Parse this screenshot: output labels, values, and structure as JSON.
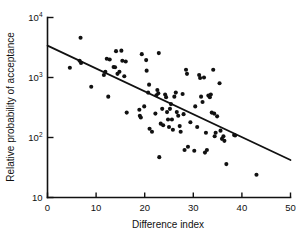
{
  "chart_data": {
    "type": "scatter",
    "title": "",
    "xlabel": "Difference index",
    "ylabel": "Relative probability of acceptance",
    "xlim": [
      0,
      50
    ],
    "ylim": [
      10,
      10000
    ],
    "yscale": "log",
    "xscale": "linear",
    "grid": false,
    "legend": null,
    "xticks": [
      0,
      10,
      20,
      30,
      40,
      50
    ],
    "xticklabels": [
      "0",
      "10",
      "20",
      "30",
      "40",
      "50"
    ],
    "yticks": [
      10,
      100,
      1000,
      10000
    ],
    "yticklabels": [
      "10",
      "10²",
      "10³",
      "10⁴"
    ],
    "ytick_mantissa": [
      "10",
      "10",
      "10",
      "10"
    ],
    "ytick_exponent": [
      "",
      "2",
      "3",
      "4"
    ],
    "series": [
      {
        "name": "observations",
        "marker": "filled-circle",
        "color": "#111111",
        "points": [
          [
            6.8,
            4600
          ],
          [
            4.6,
            1450
          ],
          [
            6.6,
            1900
          ],
          [
            6.9,
            1750
          ],
          [
            9.0,
            700
          ],
          [
            11.6,
            1100
          ],
          [
            11.9,
            1250
          ],
          [
            12.2,
            2050
          ],
          [
            12.8,
            2000
          ],
          [
            12.5,
            480
          ],
          [
            13.6,
            1500
          ],
          [
            13.9,
            1480
          ],
          [
            14.1,
            2750
          ],
          [
            14.4,
            1150
          ],
          [
            14.8,
            1250
          ],
          [
            15.2,
            2800
          ],
          [
            15.4,
            1900
          ],
          [
            15.8,
            1050
          ],
          [
            16.1,
            1850
          ],
          [
            16.3,
            260
          ],
          [
            18.9,
            290
          ],
          [
            19.0,
            230
          ],
          [
            19.2,
            215
          ],
          [
            19.4,
            2450
          ],
          [
            19.9,
            330
          ],
          [
            20.3,
            1950
          ],
          [
            20.4,
            1300
          ],
          [
            20.7,
            560
          ],
          [
            20.9,
            760
          ],
          [
            21.0,
            140
          ],
          [
            21.5,
            125
          ],
          [
            22.2,
            250
          ],
          [
            22.4,
            505
          ],
          [
            22.6,
            620
          ],
          [
            22.8,
            545
          ],
          [
            22.9,
            2550
          ],
          [
            23.0,
            47
          ],
          [
            23.3,
            170
          ],
          [
            23.6,
            300
          ],
          [
            23.8,
            160
          ],
          [
            24.2,
            520
          ],
          [
            24.4,
            470
          ],
          [
            24.6,
            265
          ],
          [
            24.8,
            200
          ],
          [
            25.0,
            150
          ],
          [
            25.2,
            300
          ],
          [
            25.4,
            360
          ],
          [
            25.6,
            200
          ],
          [
            25.8,
            135
          ],
          [
            26.1,
            480
          ],
          [
            26.4,
            560
          ],
          [
            26.6,
            265
          ],
          [
            26.9,
            230
          ],
          [
            27.2,
            155
          ],
          [
            27.4,
            125
          ],
          [
            27.8,
            530
          ],
          [
            28.0,
            245
          ],
          [
            28.2,
            62
          ],
          [
            28.5,
            1350
          ],
          [
            28.7,
            1150
          ],
          [
            28.9,
            70
          ],
          [
            29.4,
            180
          ],
          [
            30.2,
            60
          ],
          [
            30.4,
            330
          ],
          [
            30.8,
            150
          ],
          [
            31.2,
            1100
          ],
          [
            31.4,
            980
          ],
          [
            31.6,
            480
          ],
          [
            31.9,
            390
          ],
          [
            32.2,
            1000
          ],
          [
            32.4,
            56
          ],
          [
            32.6,
            120
          ],
          [
            32.8,
            62
          ],
          [
            33.1,
            500
          ],
          [
            33.4,
            470
          ],
          [
            33.6,
            520
          ],
          [
            33.8,
            260
          ],
          [
            34.1,
            1350
          ],
          [
            34.3,
            250
          ],
          [
            34.4,
            105
          ],
          [
            34.6,
            120
          ],
          [
            34.9,
            225
          ],
          [
            35.4,
            800
          ],
          [
            35.6,
            130
          ],
          [
            35.9,
            95
          ],
          [
            36.2,
            105
          ],
          [
            36.4,
            88
          ],
          [
            36.8,
            36
          ],
          [
            38.4,
            110
          ],
          [
            38.6,
            108
          ],
          [
            43.0,
            24
          ]
        ]
      }
    ],
    "fit_line": {
      "name": "regression-line",
      "x_start": 0,
      "y_start": 3400,
      "x_end": 50,
      "y_end": 42,
      "color": "#111111"
    }
  }
}
